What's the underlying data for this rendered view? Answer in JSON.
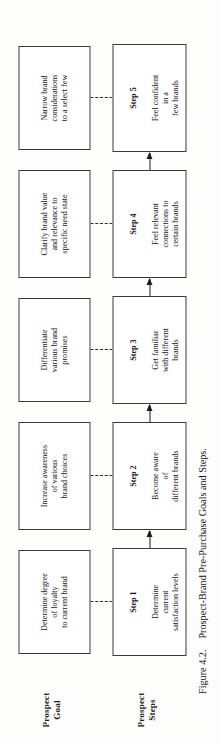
{
  "figure": {
    "number_label": "Figure 4.2.",
    "caption_text": "Prospect-Brand Pre-Purchase Goals and Steps.",
    "orientation": "rotated-90-ccw"
  },
  "rows": {
    "goal_label": "Prospect\nGoal",
    "steps_label": "Prospect\nSteps"
  },
  "goals": [
    {
      "id": "goal-1",
      "text": "Determine degree\nof loyalty\nto current brand"
    },
    {
      "id": "goal-2",
      "text": "Increase awareness\nof various\nbrand choices"
    },
    {
      "id": "goal-3",
      "text": "Differentiate\nvarious brand\npromises"
    },
    {
      "id": "goal-4",
      "text": "Clarify brand value\nand relevance to\nspecific need state"
    },
    {
      "id": "goal-5",
      "text": "Narrow brand\nconsiderations\nto a select few"
    }
  ],
  "steps": [
    {
      "id": "step-1",
      "heading": "Step 1",
      "body": "Determine\ncurrent\nsatisfaction levels"
    },
    {
      "id": "step-2",
      "heading": "Step 2",
      "body": "Become aware\nof\ndifferent brands"
    },
    {
      "id": "step-3",
      "heading": "Step 3",
      "body": "Get familiar\nwith different\nbrands"
    },
    {
      "id": "step-4",
      "heading": "Step 4",
      "body": "Feel relevant\nconnections to\ncertain brands"
    },
    {
      "id": "step-5",
      "heading": "Step 5",
      "body": "Feel confident\nin a\nfew brands"
    }
  ],
  "connectors": {
    "goal_to_step_style": "dashed",
    "step_to_step_style": "solid-arrow",
    "flow_direction": "step-1 to step-5"
  },
  "colors": {
    "page_background": "#fdfdfc",
    "box_border": "#3a3a3a",
    "text": "#161616",
    "arrow": "#1c1c1c"
  }
}
